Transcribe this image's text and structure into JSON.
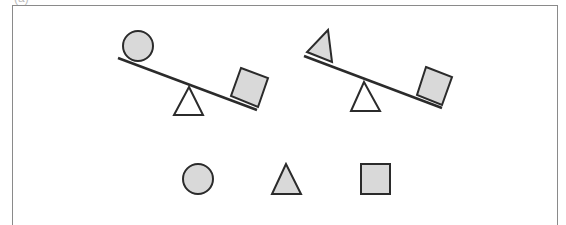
{
  "figure": {
    "label": "(a)",
    "colors": {
      "stroke": "#2b2b2b",
      "fill": "#d9d9d9",
      "frame": "#8a8a8a",
      "background": "#ffffff"
    },
    "seesaws": [
      {
        "id": "seesaw-1",
        "left_item": "circle",
        "right_item": "square",
        "heavier_side": "right"
      },
      {
        "id": "seesaw-2",
        "left_item": "triangle",
        "right_item": "square",
        "heavier_side": "right"
      }
    ],
    "shape_row": [
      "circle",
      "triangle",
      "square"
    ]
  }
}
